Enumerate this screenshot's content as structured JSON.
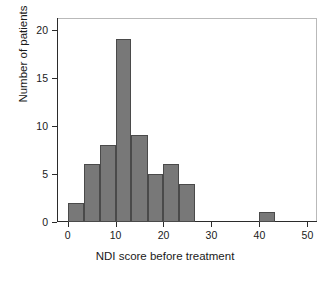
{
  "chart_data": {
    "type": "bar",
    "title": "",
    "subtitle": "",
    "xlabel": "NDI score before treatment",
    "ylabel": "Number of patients",
    "xlim": [
      -2.2,
      52
    ],
    "ylim": [
      0,
      21.2
    ],
    "grid": false,
    "legend": null,
    "bin_width": 3.333,
    "bar_color": "#787878",
    "bar_edge_color": "#4a4a4a",
    "x_ticks": [
      0,
      10,
      20,
      30,
      40,
      50
    ],
    "x_tick_labels": [
      "0",
      "10",
      "20",
      "30",
      "40",
      "50"
    ],
    "y_ticks": [
      0,
      5,
      10,
      15,
      20
    ],
    "y_tick_labels": [
      "0",
      "5",
      "10",
      "15",
      "20"
    ],
    "bins": [
      {
        "x0": 0.0,
        "x1": 3.33,
        "value": 2
      },
      {
        "x0": 3.33,
        "x1": 6.67,
        "value": 6
      },
      {
        "x0": 6.67,
        "x1": 10.0,
        "value": 8
      },
      {
        "x0": 10.0,
        "x1": 13.33,
        "value": 19
      },
      {
        "x0": 13.33,
        "x1": 16.67,
        "value": 9
      },
      {
        "x0": 16.67,
        "x1": 20.0,
        "value": 5
      },
      {
        "x0": 20.0,
        "x1": 23.33,
        "value": 6
      },
      {
        "x0": 23.33,
        "x1": 26.67,
        "value": 4
      },
      {
        "x0": 40.0,
        "x1": 43.33,
        "value": 1
      }
    ],
    "categories": [
      "0-3.3",
      "3.3-6.7",
      "6.7-10",
      "10-13.3",
      "13.3-16.7",
      "16.7-20",
      "20-23.3",
      "23.3-26.7",
      "40-43.3"
    ],
    "values": [
      2,
      6,
      8,
      19,
      9,
      5,
      6,
      4,
      1
    ],
    "total_patients": 60
  }
}
